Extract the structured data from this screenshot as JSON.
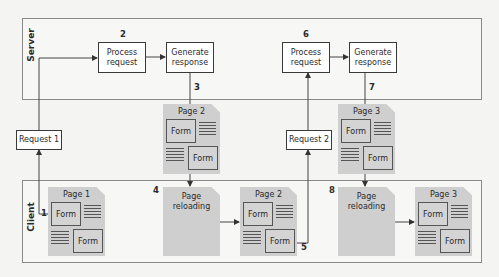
{
  "zones": {
    "server": {
      "label": "Server"
    },
    "client": {
      "label": "Client"
    }
  },
  "server": {
    "cycle1": {
      "process": {
        "label_line1": "Process",
        "label_line2": "request",
        "step": "2"
      },
      "generate": {
        "label_line1": "Generate",
        "label_line2": "response",
        "step": "3"
      }
    },
    "cycle2": {
      "process": {
        "label_line1": "Process",
        "label_line2": "request",
        "step": "6"
      },
      "generate": {
        "label_line1": "Generate",
        "label_line2": "response",
        "step": "7"
      }
    }
  },
  "requests": [
    {
      "label": "Request 1"
    },
    {
      "label": "Request 2"
    }
  ],
  "transit_pages": [
    {
      "title": "Page 2",
      "form1": "Form",
      "form2": "Form"
    },
    {
      "title": "Page 3",
      "form1": "Form",
      "form2": "Form"
    }
  ],
  "client": {
    "page1": {
      "title": "Page 1",
      "form1": "Form",
      "form2": "Form",
      "step": "1"
    },
    "reload1": {
      "line1": "Page",
      "line2": "reloading",
      "step": "4"
    },
    "page2": {
      "title": "Page 2",
      "form1": "Form",
      "form2": "Form",
      "step": "5"
    },
    "reload2": {
      "line1": "Page",
      "line2": "reloading",
      "step": "8"
    },
    "page3": {
      "title": "Page 3",
      "form1": "Form",
      "form2": "Form"
    }
  }
}
